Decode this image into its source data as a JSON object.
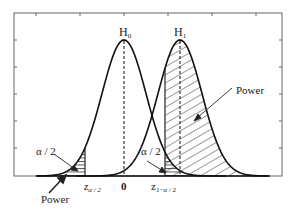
{
  "diagram": {
    "type": "hypothesis-test-power",
    "curves": [
      {
        "name": "H0",
        "label_main": "H",
        "label_sub": "0",
        "center_label": "0"
      },
      {
        "name": "H1",
        "label_main": "H",
        "label_sub": "1"
      }
    ],
    "labels": {
      "h0_main": "H",
      "h0_sub": "0",
      "h1_main": "H",
      "h1_sub": "1",
      "power_right": "Power",
      "power_left": "Power",
      "alpha_left": "α / 2",
      "alpha_right": "α / 2",
      "z_left_main": "z",
      "z_left_sub": "α / 2",
      "zero": "0",
      "z_right_main": "z",
      "z_right_sub": "1−α / 2"
    },
    "colors": {
      "line": "#222222",
      "axis": "#555555",
      "background": "#ffffff"
    }
  }
}
